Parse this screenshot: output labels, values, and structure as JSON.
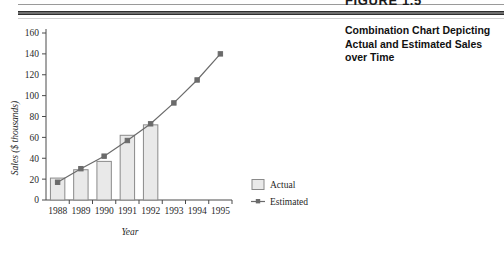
{
  "figure": {
    "number": "FIGURE 1.5",
    "caption": "Combination Chart Depicting Actual and Estimated Sales over Time"
  },
  "chart_data": {
    "type": "bar",
    "title": "",
    "subtitle": "",
    "xlabel": "Year",
    "ylabel": "Sales ($ thousands)",
    "categories": [
      "1988",
      "1989",
      "1990",
      "1991",
      "1992",
      "1993",
      "1994",
      "1995"
    ],
    "ylim": [
      0,
      160
    ],
    "yticks": [
      0,
      20,
      40,
      60,
      80,
      100,
      120,
      140,
      160
    ],
    "ytick_labels": [
      "0",
      "20",
      "40",
      "60",
      "80",
      "100",
      "120",
      "140",
      "160"
    ],
    "grid": false,
    "legend_position": "right",
    "series": [
      {
        "name": "Actual",
        "kind": "bar",
        "x": [
          "1988",
          "1989",
          "1990",
          "1991",
          "1992"
        ],
        "values": [
          21,
          29,
          37,
          62,
          72
        ],
        "fill": "#e9e9e9",
        "stroke": "#8a8a8a"
      },
      {
        "name": "Estimated",
        "kind": "line",
        "x": [
          "1988",
          "1989",
          "1990",
          "1991",
          "1992",
          "1993",
          "1994",
          "1995"
        ],
        "values": [
          17,
          30,
          42,
          57,
          73,
          93,
          115,
          140
        ],
        "stroke": "#6b6b6b",
        "marker": "square"
      }
    ]
  },
  "legend": {
    "items": [
      {
        "label": "Actual",
        "swatch": "box"
      },
      {
        "label": "Estimated",
        "swatch": "line-marker"
      }
    ]
  },
  "colors": {
    "bar_fill": "#e9e9e9",
    "bar_stroke": "#8a8a8a",
    "line": "#6b6b6b",
    "axis": "#4a4a4a",
    "text": "#1f1f1f",
    "rule_dark": "#2e2e2e"
  }
}
